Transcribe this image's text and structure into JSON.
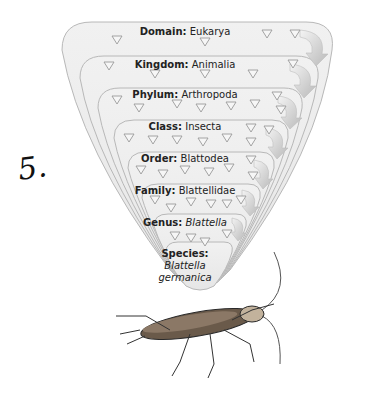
{
  "figure": {
    "handwritten_label": "5.",
    "levels": [
      {
        "rank": "Domain:",
        "name": "Eukarya",
        "italic": false
      },
      {
        "rank": "Kingdom:",
        "name": "Animalia",
        "italic": false
      },
      {
        "rank": "Phylum:",
        "name": "Arthropoda",
        "italic": false
      },
      {
        "rank": "Class:",
        "name": "Insecta",
        "italic": false
      },
      {
        "rank": "Order:",
        "name": "Blattodea",
        "italic": false
      },
      {
        "rank": "Family:",
        "name": "Blattellidae",
        "italic": false
      },
      {
        "rank": "Genus:",
        "name": "Blattella",
        "italic": true
      }
    ],
    "species": {
      "rank": "Species:",
      "line1": "Blattella",
      "line2": "germanica"
    },
    "illustration": "german-cockroach",
    "colors": {
      "funnel_fill": "#ececec",
      "funnel_stroke": "#b8b8b8",
      "arrow_fill": "#cfcfcf",
      "triangle_stroke": "#9a9a9a"
    }
  }
}
